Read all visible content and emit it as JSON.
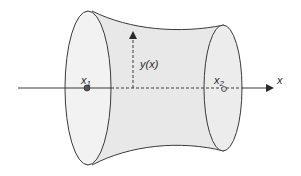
{
  "diagram": {
    "type": "surface-of-revolution",
    "labels": {
      "function": "y(x)",
      "x1": "x",
      "x1_sub": "1",
      "x2": "x",
      "x2_sub": "2",
      "axis": "x"
    },
    "colors": {
      "stroke": "#3a3a3a",
      "fill_body": "#e6e6e6",
      "fill_end": "#efefef",
      "background": "#ffffff"
    }
  }
}
